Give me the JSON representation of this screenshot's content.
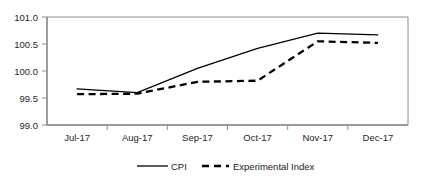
{
  "chart_data": {
    "type": "line",
    "title": "",
    "xlabel": "",
    "ylabel": "",
    "categories": [
      "Jul-17",
      "Aug-17",
      "Sep-17",
      "Oct-17",
      "Nov-17",
      "Dec-17"
    ],
    "ylim": [
      99.0,
      101.0
    ],
    "yticks": [
      "99.0",
      "99.5",
      "100.0",
      "100.5",
      "101.0"
    ],
    "ytick_values": [
      99.0,
      99.5,
      100.0,
      100.5,
      101.0
    ],
    "grid": false,
    "legend_position": "bottom",
    "series": [
      {
        "name": "CPI",
        "style": "solid",
        "color": "#000000",
        "values": [
          99.67,
          99.6,
          100.05,
          100.42,
          100.7,
          100.67
        ]
      },
      {
        "name": "Experimental Index",
        "style": "dashed",
        "color": "#000000",
        "values": [
          99.57,
          99.58,
          99.8,
          99.82,
          100.55,
          100.52
        ]
      }
    ]
  },
  "axis": {
    "ytick_0": "99.0",
    "ytick_1": "99.5",
    "ytick_2": "100.0",
    "ytick_3": "100.5",
    "ytick_4": "101.0",
    "xtick_0": "Jul-17",
    "xtick_1": "Aug-17",
    "xtick_2": "Sep-17",
    "xtick_3": "Oct-17",
    "xtick_4": "Nov-17",
    "xtick_5": "Dec-17"
  },
  "legend": {
    "item_0": "CPI",
    "item_1": "Experimental Index"
  },
  "style": {
    "plot_border_color": "#8c8c8c",
    "line_color": "#000000",
    "background": "#ffffff"
  }
}
